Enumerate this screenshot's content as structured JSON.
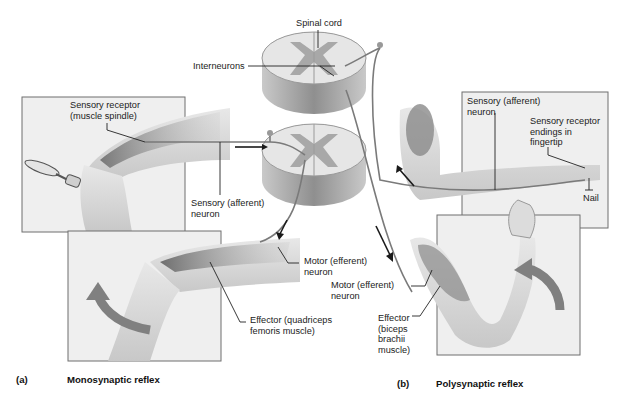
{
  "diagram": {
    "colors": {
      "panel_fill": "#eeeeee",
      "panel_border": "#6f6f6f",
      "skin": "#dcdcdc",
      "muscle": "#8a8a8a",
      "gray_matter": "#a8a8a8",
      "white_matter": "#e6e6e6",
      "cord_side": "#9a9a9a",
      "neuron_line": "#7a7a7a",
      "arrow_dark": "#1a1a1a",
      "motion_arrow": "#808080"
    },
    "labels": {
      "spinal_cord": "Spinal cord",
      "interneurons": "Interneurons",
      "sensory_receptor_spindle": "Sensory receptor\n(muscle spindle)",
      "sensory_afferent_a": "Sensory (afferent)\nneuron",
      "motor_efferent_a": "Motor (efferent)\nneuron",
      "effector_quadriceps": "Effector (quadriceps\nfemoris muscle)",
      "sensory_afferent_b": "Sensory (afferent)\nneuron",
      "sensory_receptor_fingertip": "Sensory receptor\nendings in\nfingertip",
      "nail": "Nail",
      "motor_efferent_b": "Motor (efferent)\nneuron",
      "effector_biceps": "Effector\n(biceps\nbrachii\nmuscle)"
    },
    "captions": {
      "a_letter": "(a)",
      "a_title": "Monosynaptic reflex",
      "b_letter": "(b)",
      "b_title": "Polysynaptic reflex"
    }
  }
}
